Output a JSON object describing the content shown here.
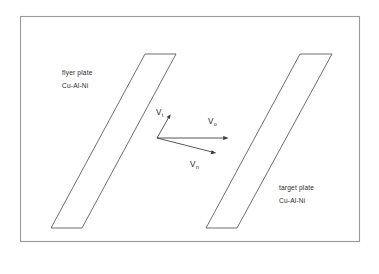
{
  "figure": {
    "background_color": "#ffffff",
    "frame": {
      "stroke_color": "#9a9a9a",
      "x": 20,
      "y": 16,
      "width": 340,
      "height": 226
    },
    "plates": [
      {
        "id": "flyer-plate",
        "name": "flyer plate",
        "material": "Cu-Al-Ni",
        "label": "flyer plate",
        "stroke_color": "#4a4a4a",
        "fill_color": "#ffffff",
        "points": "145,54 176,54 82,228 51,228"
      },
      {
        "id": "target-plate",
        "name": "target plate",
        "material": "Cu-Al-Ni",
        "label": "target plate",
        "stroke_color": "#4a4a4a",
        "fill_color": "#ffffff",
        "points": "300,54 332,54 237,228 206,228"
      }
    ],
    "vectors": [
      {
        "id": "vt",
        "symbol": "V",
        "subscript": "t",
        "label": "V t",
        "description": "tangential velocity component",
        "origin": [
          157,
          138
        ],
        "tip": [
          170,
          115
        ],
        "stroke_color": "#3a3a3a"
      },
      {
        "id": "v0",
        "symbol": "V",
        "subscript": "o",
        "label": "V o",
        "description": "impact velocity",
        "origin": [
          157,
          138
        ],
        "tip": [
          228,
          138
        ],
        "stroke_color": "#3a3a3a"
      },
      {
        "id": "vn",
        "symbol": "V",
        "subscript": "n",
        "label": "V n",
        "description": "normal velocity component",
        "origin": [
          157,
          138
        ],
        "tip": [
          216,
          153
        ],
        "stroke_color": "#3a3a3a"
      }
    ]
  }
}
